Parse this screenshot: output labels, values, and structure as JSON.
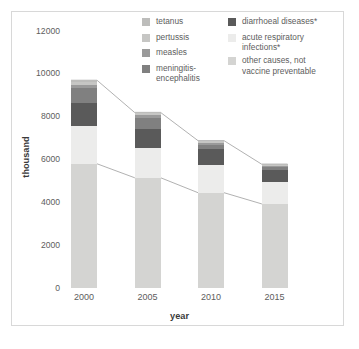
{
  "chart_data": {
    "type": "bar",
    "stacked": true,
    "title": "",
    "subtitle": "",
    "xlabel": "year",
    "ylabel": "thousand",
    "categories": [
      "2000",
      "2005",
      "2010",
      "2015"
    ],
    "ylim": [
      0,
      12000
    ],
    "yticks": [
      0,
      2000,
      4000,
      6000,
      8000,
      10000,
      12000
    ],
    "ytick_labels": [
      "0",
      "2000",
      "4000",
      "6000",
      "8000",
      "10000",
      "12000"
    ],
    "grid": false,
    "legend_position": "top-center",
    "series": [
      {
        "name": "other causes, not vaccine preventable",
        "color": "#d4d4d2",
        "values": [
          5800,
          5150,
          4450,
          3930
        ]
      },
      {
        "name": "acute respiratory infections*",
        "color": "#ececeb",
        "values": [
          1750,
          1400,
          1270,
          1030
        ]
      },
      {
        "name": "diarrhoeal diseases*",
        "color": "#5a5a5a",
        "values": [
          1100,
          880,
          750,
          540
        ]
      },
      {
        "name": "meningitis-encephalitis",
        "color": "#808080",
        "values": [
          680,
          490,
          200,
          130
        ]
      },
      {
        "name": "measles",
        "color": "#9a9a9a",
        "values": [
          150,
          140,
          110,
          75
        ]
      },
      {
        "name": "pertussis",
        "color": "#c6c6c4",
        "values": [
          160,
          100,
          70,
          55
        ]
      },
      {
        "name": "tetanus",
        "color": "#bdbdbb",
        "values": [
          60,
          40,
          30,
          25
        ]
      }
    ],
    "totals": [
      9700,
      8160,
      6880,
      5785
    ],
    "annotations": [
      "Connector lines link the top of each bar to the next bar's top",
      "Connector lines link the top of the 'other causes' segment across bars"
    ]
  },
  "legend": {
    "left_column": [
      {
        "label": "tetanus",
        "color": "#bdbdbb"
      },
      {
        "label": "pertussis",
        "color": "#c6c6c4"
      },
      {
        "label": "measles",
        "color": "#9a9a9a"
      },
      {
        "label": "meningitis-\nencephalitis",
        "color": "#808080"
      }
    ],
    "right_column": [
      {
        "label": "diarrhoeal diseases*",
        "color": "#5a5a5a"
      },
      {
        "label": "acute respiratory\ninfections*",
        "color": "#ececeb"
      },
      {
        "label": "other causes, not\nvaccine preventable",
        "color": "#d4d4d2"
      }
    ]
  },
  "axes": {
    "y_label": "thousand",
    "x_label": "year",
    "y_ticks": [
      "12000",
      "10000",
      "8000",
      "6000",
      "4000",
      "2000",
      "0"
    ],
    "x_ticks": [
      "2000",
      "2005",
      "2010",
      "2015"
    ]
  },
  "colors": {
    "frame": "#d8d8d8",
    "text": "#5d5d5d",
    "text_bold": "#3a3a3a",
    "connector": "#a8a8a8",
    "background": "#ffffff"
  }
}
